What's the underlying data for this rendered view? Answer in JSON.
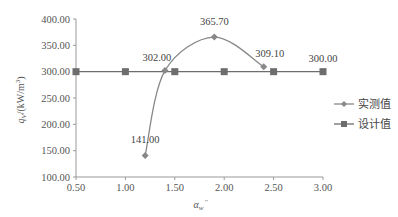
{
  "chart_data": {
    "type": "line",
    "title": "",
    "xlabel": "α_w''",
    "ylabel": "q_V/(kW/m³)",
    "xlim": [
      0.5,
      3.0
    ],
    "ylim": [
      100,
      400
    ],
    "x_ticks": [
      "0.50",
      "1.00",
      "1.50",
      "2.00",
      "2.50",
      "3.00"
    ],
    "y_ticks": [
      "100.00",
      "150.00",
      "200.00",
      "250.00",
      "300.00",
      "350.00",
      "400.00"
    ],
    "grid": false,
    "legend_position": "right",
    "series": [
      {
        "name": "实测值",
        "marker": "diamond",
        "smooth": true,
        "color": "#888888",
        "x": [
          1.2,
          1.4,
          1.9,
          2.4
        ],
        "values": [
          141.0,
          302.0,
          365.7,
          309.1
        ],
        "labels": [
          "141.00",
          "302.00",
          "365.70",
          "309.10"
        ]
      },
      {
        "name": "设计值",
        "marker": "square",
        "smooth": false,
        "color": "#6d6d6d",
        "x": [
          0.5,
          1.0,
          1.5,
          2.0,
          2.5,
          3.0
        ],
        "values": [
          300,
          300,
          300,
          300,
          300,
          300
        ],
        "labels": [
          "",
          "",
          "",
          "",
          "",
          "300.00"
        ]
      }
    ]
  },
  "legend": {
    "items": [
      {
        "label": "实测值",
        "marker": "diamond"
      },
      {
        "label": "设计值",
        "marker": "square"
      }
    ]
  },
  "axes": {
    "ylabel_main": "q",
    "ylabel_sub": "V",
    "ylabel_unit": "/(kW/m",
    "ylabel_sup": "3",
    "ylabel_close": ")",
    "xlabel_main": "α",
    "xlabel_sub": "w",
    "xlabel_prime": "''"
  }
}
